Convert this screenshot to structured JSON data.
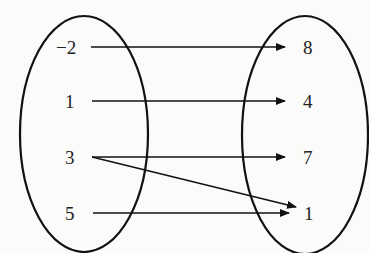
{
  "diagram": {
    "type": "mapping-diagram",
    "domain_set": [
      "−2",
      "1",
      "3",
      "5"
    ],
    "range_set": [
      "8",
      "4",
      "7",
      "1"
    ],
    "mappings": [
      {
        "from": "−2",
        "to": "8"
      },
      {
        "from": "1",
        "to": "4"
      },
      {
        "from": "3",
        "to": "7"
      },
      {
        "from": "3",
        "to": "1"
      },
      {
        "from": "5",
        "to": "1"
      }
    ],
    "colors": {
      "stroke": "#111111",
      "text": "#222222",
      "background": "#fbfbf9"
    }
  }
}
